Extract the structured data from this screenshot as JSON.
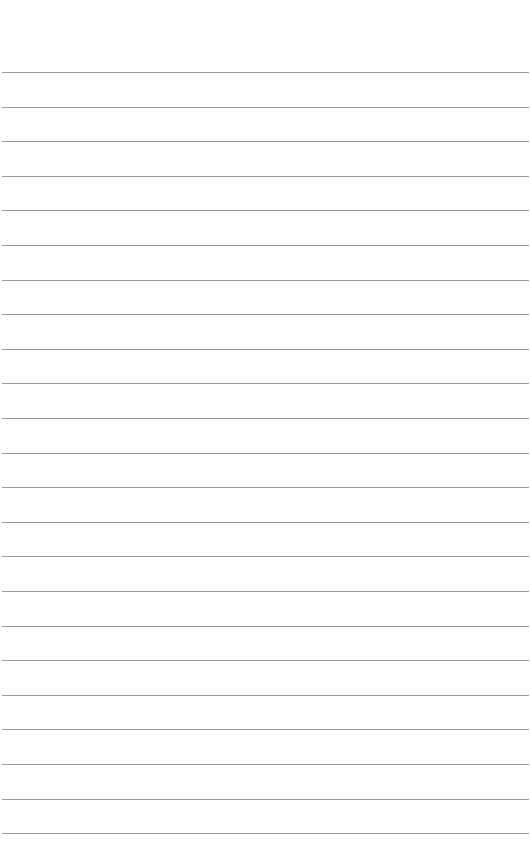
{
  "page": {
    "type": "ruled-paper",
    "background": "#ffffff",
    "line_color": "#9a9a9a",
    "line_count": 23,
    "first_line_y": 72,
    "line_spacing": 34.6,
    "text": ""
  }
}
